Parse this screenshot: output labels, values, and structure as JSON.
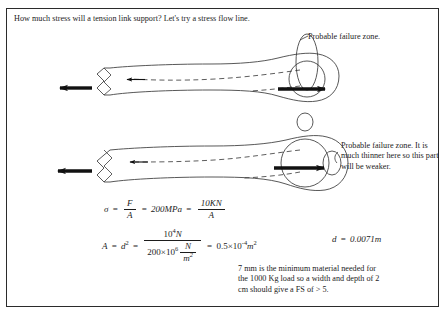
{
  "document": {
    "header": "How much stress will a tension link support? Let's try a stress flow line.",
    "border_color": "#2b2b2b",
    "ink_color": "#1c1c1c",
    "background": "#ffffff"
  },
  "annotations": {
    "top_label": "Probable failure zone.",
    "bottom_label": "Probable failure zone. It is much thinner here so this part will be weaker.",
    "bottom_note": "7 mm is the minimum material needed for the 1000 Kg load so a width and depth of 2 cm should give a FS of > 5."
  },
  "diagram": {
    "upper_link": {
      "name": "tension-link-thin-section",
      "load_arrow_left": "left-pointing-load-arrow",
      "load_arrow_right": "right-pointing-load-arrow",
      "flow_line": "dashed-stress-flow-line",
      "eye_hole": "pin-hole-circle",
      "failure_zone": "vertical-ellipse-failure-zone"
    },
    "lower_link": {
      "name": "tension-link-large-hole",
      "load_arrow_left": "left-pointing-load-arrow",
      "load_arrow_right": "right-pointing-load-arrow",
      "flow_line": "dashed-stress-flow-line",
      "eye_hole": "large-pin-hole-circle",
      "failure_zone": "vertical-ellipse-failure-zone"
    }
  },
  "equations": {
    "eq1": {
      "sigma": "σ",
      "frac1_num": "F",
      "frac1_den": "A",
      "eq_op": "=",
      "stress_value": "200MPa",
      "frac2_num": "10KN",
      "frac2_den": "A"
    },
    "eq2": {
      "lhs": "A",
      "lhs_exp": "2",
      "lhs2": "d",
      "lhs2_exp": "2",
      "num_base": "10",
      "num_exp": "4",
      "num_unit": "N",
      "den_coef": "200×10",
      "den_exp": "6",
      "den_unit_num": "N",
      "den_unit_den": "m",
      "den_unit_den_exp": "2",
      "result_coef": "0.5×10",
      "result_exp": "-4",
      "result_unit": "m",
      "result_unit_exp": "2"
    },
    "eq3": {
      "symbol": "d",
      "equals": "=",
      "value": "0.0071m"
    }
  }
}
